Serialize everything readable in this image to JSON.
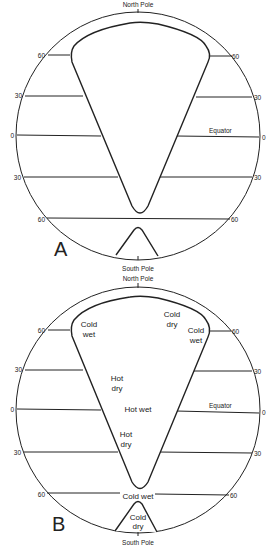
{
  "figure": {
    "panels": [
      {
        "id": "A",
        "panel_label": "A",
        "pole_labels": {
          "north": "North Pole",
          "south": "South Pole"
        },
        "latitude_labels_left": [
          "60",
          "30",
          "0",
          "30",
          "60"
        ],
        "latitude_labels_right": [
          "60",
          "30",
          "0",
          "30",
          "60"
        ],
        "equator_label": "Equator",
        "climate_labels": []
      },
      {
        "id": "B",
        "panel_label": "B",
        "pole_labels": {
          "north": "North Pole",
          "south": "South Pole"
        },
        "latitude_labels_left": [
          "60",
          "30",
          "0",
          "30",
          "60"
        ],
        "latitude_labels_right": [
          "60",
          "30",
          "0",
          "30",
          "60"
        ],
        "equator_label": "Equator",
        "climate_labels": [
          {
            "line1": "Cold",
            "line2": "wet"
          },
          {
            "line1": "Cold",
            "line2": "dry"
          },
          {
            "line1": "Cold",
            "line2": "wet"
          },
          {
            "line1": "Hot",
            "line2": "dry"
          },
          {
            "line1": "Hot wet",
            "line2": ""
          },
          {
            "line1": "Hot",
            "line2": "dry"
          },
          {
            "line1": "Cold wet",
            "line2": ""
          },
          {
            "line1": "Cold",
            "line2": "dry"
          }
        ]
      }
    ]
  }
}
